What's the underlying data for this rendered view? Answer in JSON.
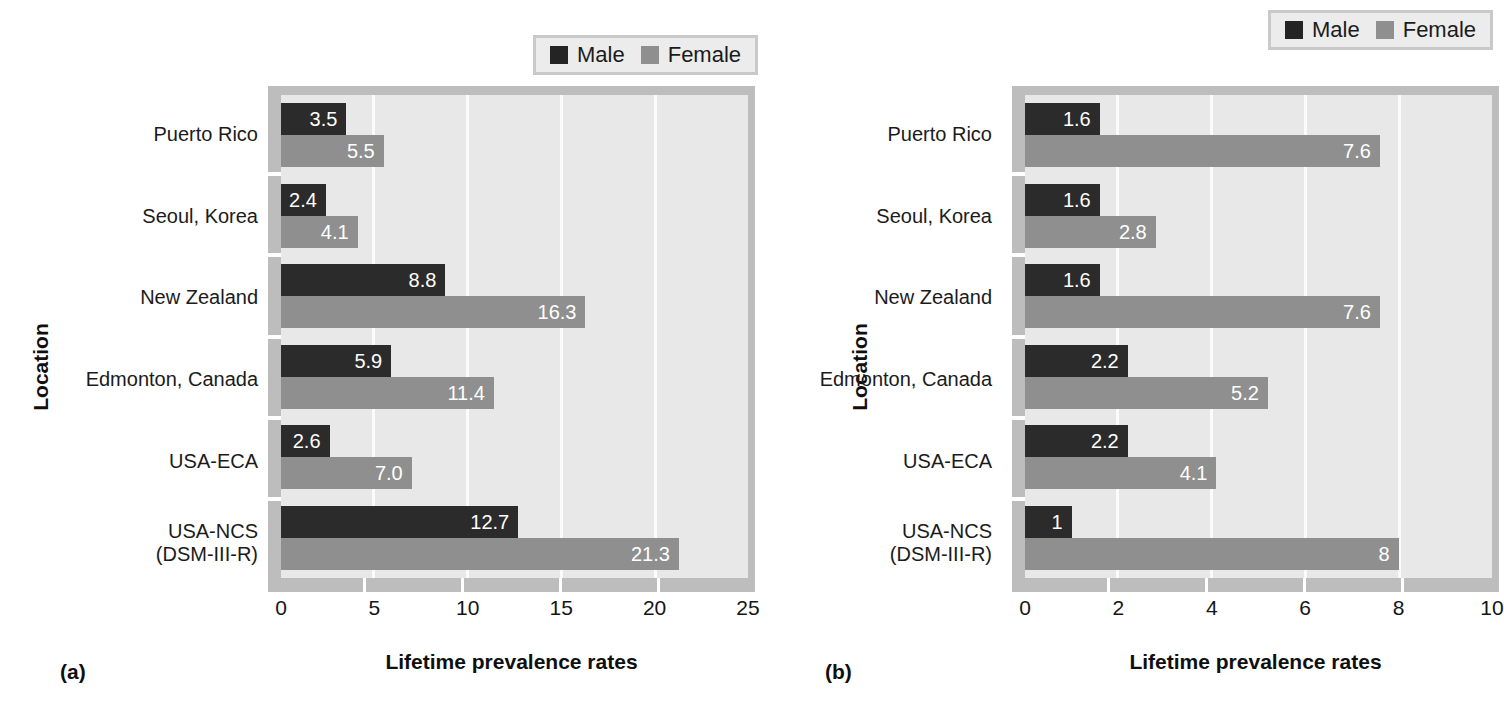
{
  "figure": {
    "panels": [
      {
        "caption": "(a)",
        "legend": [
          {
            "label": "Male",
            "color": "#242424",
            "swatch": "male"
          },
          {
            "label": "Female",
            "color": "#8f8f8f",
            "swatch": "female"
          }
        ],
        "chart_data": {
          "type": "bar",
          "orientation": "horizontal",
          "title": "",
          "xlabel": "Lifetime prevalence rates",
          "ylabel": "Location",
          "xlim": [
            0,
            25
          ],
          "xticks": [
            0,
            5,
            10,
            15,
            20,
            25
          ],
          "grid": true,
          "legend_position": "top-right",
          "categories": [
            "Puerto Rico",
            "Seoul, Korea",
            "New Zealand",
            "Edmonton, Canada",
            "USA-ECA",
            "USA-NCS\n(DSM-III-R)"
          ],
          "series": [
            {
              "name": "Male",
              "values": [
                3.5,
                2.4,
                8.8,
                5.9,
                2.6,
                12.7
              ],
              "labels": [
                "3.5",
                "2.4",
                "8.8",
                "5.9",
                "2.6",
                "12.7"
              ]
            },
            {
              "name": "Female",
              "values": [
                5.5,
                4.1,
                16.3,
                11.4,
                7.0,
                21.3
              ],
              "labels": [
                "5.5",
                "4.1",
                "16.3",
                "11.4",
                "7.0",
                "21.3"
              ]
            }
          ]
        }
      },
      {
        "caption": "(b)",
        "legend": [
          {
            "label": "Male",
            "color": "#242424",
            "swatch": "male"
          },
          {
            "label": "Female",
            "color": "#8f8f8f",
            "swatch": "female"
          }
        ],
        "chart_data": {
          "type": "bar",
          "orientation": "horizontal",
          "title": "",
          "xlabel": "Lifetime prevalence rates",
          "ylabel": "Location",
          "xlim": [
            0,
            10
          ],
          "xticks": [
            0,
            2,
            4,
            6,
            8,
            10
          ],
          "grid": true,
          "legend_position": "top-right",
          "categories": [
            "Puerto Rico",
            "Seoul, Korea",
            "New Zealand",
            "Edmonton, Canada",
            "USA-ECA",
            "USA-NCS\n(DSM-III-R)"
          ],
          "series": [
            {
              "name": "Male",
              "values": [
                1.6,
                1.6,
                1.6,
                2.2,
                2.2,
                1.0
              ],
              "labels": [
                "1.6",
                "1.6",
                "1.6",
                "2.2",
                "2.2",
                "1"
              ]
            },
            {
              "name": "Female",
              "values": [
                7.6,
                2.8,
                7.6,
                5.2,
                4.1,
                8.0
              ],
              "labels": [
                "7.6",
                "2.8",
                "7.6",
                "5.2",
                "4.1",
                "8"
              ]
            }
          ]
        }
      }
    ]
  }
}
